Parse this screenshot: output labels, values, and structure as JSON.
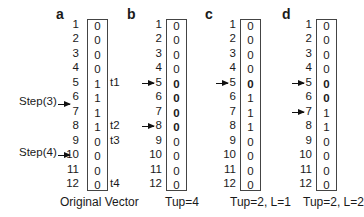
{
  "row_indices": [
    "1",
    "2",
    "3",
    "4",
    "5",
    "6",
    "7",
    "8",
    "9",
    "10",
    "11",
    "12"
  ],
  "panels": [
    {
      "letter": "a",
      "caption": "Original Vector",
      "values": [
        "0",
        "0",
        "0",
        "0",
        "1",
        "1",
        "1",
        "1",
        "0",
        "0",
        "0",
        "0"
      ],
      "bold_rows": [],
      "arrows_at_rows": [],
      "t_labels": [
        {
          "row": 5,
          "text": "t1"
        },
        {
          "row": 8,
          "text": "t2"
        },
        {
          "row": 9,
          "text": "t3"
        },
        {
          "row": 12,
          "text": "t4"
        }
      ]
    },
    {
      "letter": "b",
      "caption": "Tup=4",
      "values": [
        "0",
        "0",
        "0",
        "0",
        "0",
        "0",
        "0",
        "0",
        "0",
        "0",
        "0",
        "0"
      ],
      "bold_rows": [
        5,
        6,
        7,
        8
      ],
      "arrows_at_rows": [
        5,
        8
      ]
    },
    {
      "letter": "c",
      "caption": "Tup=2, L=1",
      "values": [
        "0",
        "0",
        "0",
        "0",
        "0",
        "1",
        "1",
        "1",
        "0",
        "0",
        "0",
        "0"
      ],
      "bold_rows": [
        5
      ],
      "arrows_at_rows": [
        5
      ]
    },
    {
      "letter": "d",
      "caption": "Tup=2, L=2",
      "values": [
        "0",
        "0",
        "0",
        "0",
        "0",
        "0",
        "1",
        "1",
        "0",
        "0",
        "0",
        "0"
      ],
      "bold_rows": [
        5,
        6
      ],
      "arrows_at_rows": [
        5,
        7
      ]
    }
  ],
  "steps": [
    {
      "label": "Step(3)",
      "row": 6.5
    },
    {
      "label": "Step(4)",
      "row": 10
    }
  ],
  "colors": {
    "text": "#1a1a1a",
    "border": "#444444",
    "background": "#ffffff"
  }
}
